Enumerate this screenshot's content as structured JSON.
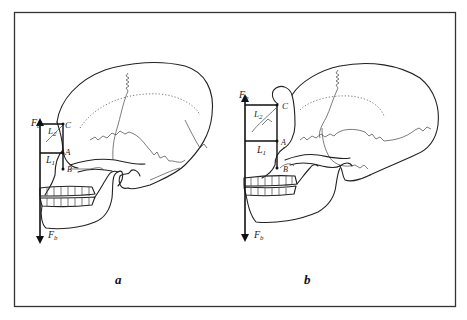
{
  "figure": {
    "panels": [
      {
        "id": "a",
        "caption": "a",
        "labels": {
          "force_top": "F",
          "force_top_sub": "b",
          "force_bottom": "F",
          "force_bottom_sub": "b",
          "point_c": "C",
          "point_a": "A",
          "point_b": "B",
          "lever_2": "L",
          "lever_2_sub": "2",
          "lever_1": "L",
          "lever_1_sub": "1"
        }
      },
      {
        "id": "b",
        "caption": "b",
        "labels": {
          "force_top": "F",
          "force_top_sub": "b",
          "force_bottom": "F",
          "force_bottom_sub": "b",
          "point_c": "C",
          "point_a": "A",
          "point_b": "B",
          "lever_2": "L",
          "lever_2_sub": "2",
          "lever_1": "L",
          "lever_1_sub": "1"
        }
      }
    ],
    "colors": {
      "ink": "#222222",
      "frame": "#333333",
      "background": "#ffffff"
    }
  }
}
